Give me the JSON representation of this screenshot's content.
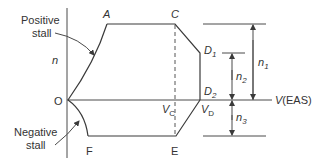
{
  "diagram": {
    "axes": {
      "y_label": "n",
      "x_label": "V(EAS)",
      "origin_label": "O"
    },
    "points": {
      "A": "A",
      "C": "C",
      "D1_main": "D",
      "D1_sub": "1",
      "D2_main": "D",
      "D2_sub": "2",
      "E": "E",
      "F": "F",
      "VC_main": "V",
      "VC_sub": "C",
      "VD_main": "V",
      "VD_sub": "D"
    },
    "annotations": {
      "positive_stall_line1": "Positive",
      "positive_stall_line2": "stall",
      "negative_stall_line1": "Negative",
      "negative_stall_line2": "stall"
    },
    "dimensions": {
      "n1_main": "n",
      "n1_sub": "1",
      "n2_main": "n",
      "n2_sub": "2",
      "n3_main": "n",
      "n3_sub": "3"
    },
    "colors": {
      "line": "#3a3a3a",
      "text": "#333333",
      "background": "#ffffff"
    }
  }
}
